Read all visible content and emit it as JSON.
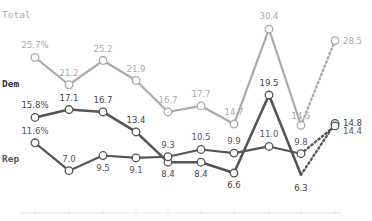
{
  "chart_data": {
    "type": "line",
    "title": "",
    "xlabel": "",
    "ylabel": "",
    "ylim": [
      0,
      35
    ],
    "grid": false,
    "x": [
      1,
      2,
      3,
      4,
      5,
      6,
      7,
      8,
      9,
      10
    ],
    "projected_from_index": 8,
    "series": [
      {
        "name": "Total",
        "color": "#aaaaaa",
        "label_color": "#aaaaaa",
        "values": [
          25.7,
          21.2,
          25.2,
          21.9,
          16.7,
          17.7,
          14.7,
          30.4,
          14.5,
          28.5
        ],
        "labels": [
          "25.7%",
          "21.2",
          "25.2",
          "21.9",
          "16.7",
          "17.7",
          "14.7",
          "30.4",
          "14.5",
          "28.5"
        ]
      },
      {
        "name": "Dem",
        "color": "#555555",
        "label_color": "#444444",
        "values": [
          15.8,
          17.1,
          16.7,
          13.4,
          8.4,
          8.4,
          6.6,
          19.5,
          6.3,
          14.8
        ],
        "labels": [
          "15.8%",
          "17.1",
          "16.7",
          "13.4",
          "8.4",
          "8.4",
          "6.6",
          "19.5",
          "6.3",
          "14.8"
        ]
      },
      {
        "name": "Rep",
        "color": "#555555",
        "label_color": "#555555",
        "values": [
          11.6,
          7.0,
          9.5,
          9.1,
          9.3,
          10.5,
          9.9,
          11.0,
          9.8,
          14.4
        ],
        "labels": [
          "11.6%",
          "7.0",
          "9.5",
          "9.1",
          "9.3",
          "10.5",
          "9.9",
          "11.0",
          "9.8",
          "14.4"
        ]
      }
    ],
    "legend": "inline-left"
  },
  "series_titles": {
    "total": "Total",
    "dem": "Dem",
    "rep": "Rep"
  }
}
